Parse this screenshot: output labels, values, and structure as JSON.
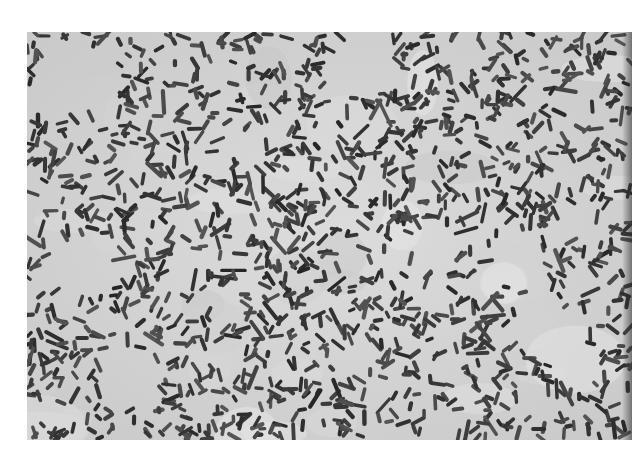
{
  "image": {
    "subject": "micrograph of rod-shaped bacteria (bacilli)",
    "style": "grayscale",
    "background_color": "#d6d6d6",
    "cell_color": "#3a3a3a",
    "page_background": "#ffffff",
    "cell_count_approx": 1400
  }
}
